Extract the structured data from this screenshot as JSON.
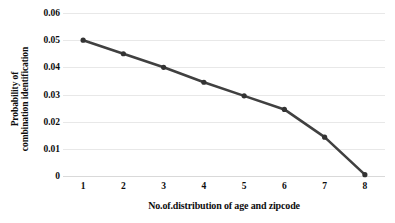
{
  "chart_data": {
    "type": "line",
    "title": "",
    "xlabel": "No.of.distribution of age and zipcode",
    "ylabel_line1": "Probability of",
    "ylabel_line2": "combination identification",
    "x": [
      1,
      2,
      3,
      4,
      5,
      6,
      7,
      8
    ],
    "xtick_labels": [
      "1",
      "2",
      "3",
      "4",
      "5",
      "6",
      "7",
      "8"
    ],
    "values": [
      0.05,
      0.045,
      0.04,
      0.0345,
      0.0295,
      0.0245,
      0.0143,
      0.0005
    ],
    "ytick_labels": [
      "0",
      "0.01",
      "0.02",
      "0.03",
      "0.04",
      "0.05",
      "0.06"
    ],
    "ytick_values": [
      0,
      0.01,
      0.02,
      0.03,
      0.04,
      0.05,
      0.06
    ],
    "ylim": [
      0,
      0.06
    ],
    "xlim": [
      0.5,
      8.5
    ],
    "grid": "horizontal",
    "legend": "none",
    "series_color": "#404040",
    "marker_color": "#333333",
    "gridline_color": "#e8e8e8",
    "background_color": "#ffffff"
  }
}
